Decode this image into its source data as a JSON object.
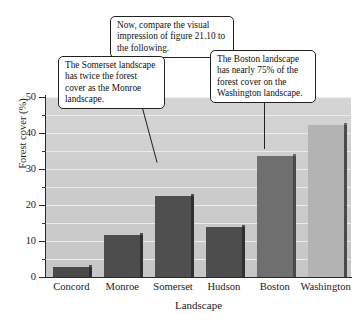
{
  "figure": {
    "title": "",
    "annotations": [
      {
        "id": "top-callout",
        "text": "Now, compare the visual impression of figure 21.10 to the following."
      },
      {
        "id": "somerset-callout",
        "text": "The Somerset landscape has twice the forest cover as the Monroe landscape."
      },
      {
        "id": "boston-callout",
        "text": "The Boston landscape has nearly 75% of the forest cover on the Washington landscape."
      }
    ]
  },
  "chart_data": {
    "type": "bar",
    "title": "",
    "categories": [
      "Concord",
      "Monroe",
      "Somerset",
      "Hudson",
      "Boston",
      "Washington"
    ],
    "values": [
      2.8,
      11.6,
      22.6,
      13.8,
      33.5,
      42.3
    ],
    "xlabel": "Landscape",
    "ylabel": "Forest cover (%)",
    "ylim": [
      0,
      50
    ],
    "ytick_labels": [
      "0",
      "10",
      "20",
      "30",
      "40",
      "50"
    ],
    "ytick_values": [
      0,
      10,
      20,
      30,
      40,
      50
    ],
    "yminor_values": [
      5,
      15,
      25,
      35,
      45
    ],
    "grid": true,
    "legend": "none",
    "bar_colors": [
      "#4a4a4a",
      "#4d4d4d",
      "#4f4f4f",
      "#4d4d4d",
      "#6f6f6f",
      "#b3b3b3"
    ],
    "plot_background": "#cfcfcf"
  },
  "colors": {
    "axis": "#2a2a2a",
    "gridline": "#ececec",
    "callout_border": "#222222",
    "callout_fill": "#ffffff",
    "text": "#111111"
  }
}
